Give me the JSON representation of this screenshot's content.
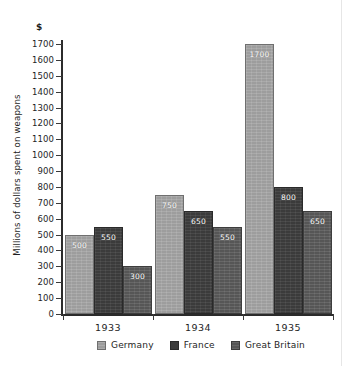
{
  "chart_data": {
    "type": "bar",
    "title": "",
    "subtitle": "",
    "xlabel": "",
    "ylabel": "Millions of dollars spent on weapons",
    "unit_symbol": "$",
    "categories": [
      "1933",
      "1934",
      "1935"
    ],
    "series": [
      {
        "name": "Germany",
        "color": "#9d9d9d",
        "values": [
          500,
          750,
          1700
        ]
      },
      {
        "name": "France",
        "color": "#3b3b3b",
        "values": [
          550,
          650,
          800
        ]
      },
      {
        "name": "Great Britain",
        "color": "#565656",
        "values": [
          300,
          550,
          650
        ]
      }
    ],
    "ylim": [
      0,
      1700
    ],
    "ytick_step": 100,
    "yticks": [
      0,
      100,
      200,
      300,
      400,
      500,
      600,
      700,
      800,
      900,
      1000,
      1100,
      1200,
      1300,
      1400,
      1500,
      1600,
      1700
    ],
    "ytick_labels": [
      "0",
      "100",
      "200",
      "300",
      "400",
      "500",
      "600",
      "700",
      "800",
      "900",
      "1000",
      "1100",
      "1200",
      "1300",
      "1400",
      "1500",
      "1600",
      "1700"
    ],
    "grid": false,
    "legend_position": "bottom",
    "value_labels_shown": true,
    "value_labels": {
      "Germany": [
        "500",
        "750",
        "1700"
      ],
      "France": [
        "550",
        "650",
        "800"
      ],
      "Great Britain": [
        "300",
        "550",
        "650"
      ]
    }
  },
  "legend": {
    "items": [
      {
        "label": "Germany"
      },
      {
        "label": "France"
      },
      {
        "label": "Great Britain"
      }
    ]
  }
}
